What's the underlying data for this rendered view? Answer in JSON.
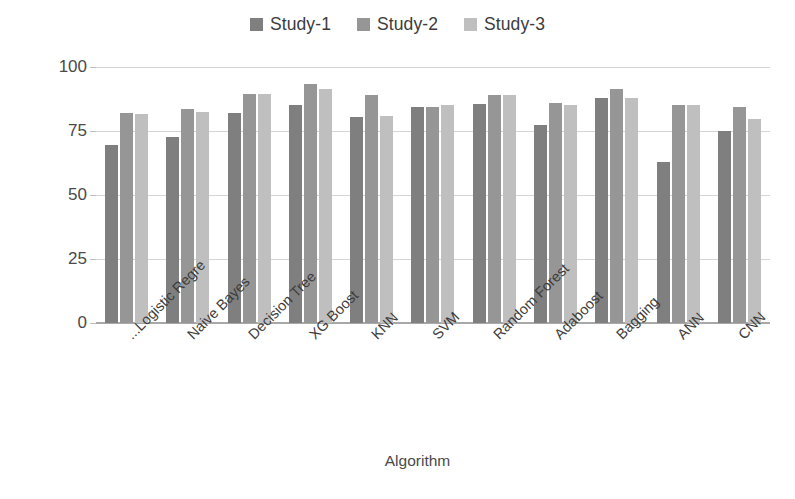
{
  "chart_data": {
    "type": "bar",
    "title": "",
    "xlabel": "Algorithm",
    "ylabel": "Accuracy (%)",
    "ylim": [
      0,
      100
    ],
    "yticks": [
      0,
      25,
      50,
      75,
      100
    ],
    "grid": true,
    "legend_position": "top-center",
    "categories": [
      "Logistic Regre...",
      "Naive Bayes",
      "Decision Tree",
      "XG Boost",
      "KNN",
      "SVM",
      "Random Forest",
      "Adaboost",
      "Bagging",
      "ANN",
      "CNN"
    ],
    "series": [
      {
        "name": "Study-1",
        "color": "#7f7f7f",
        "values": [
          69.5,
          72.5,
          82,
          85,
          80.5,
          84.5,
          85.5,
          77.5,
          88,
          63,
          75
        ]
      },
      {
        "name": "Study-2",
        "color": "#969696",
        "values": [
          82,
          83.5,
          89.5,
          93.5,
          89,
          84.5,
          89,
          86,
          91.5,
          85,
          84.5
        ]
      },
      {
        "name": "Study-3",
        "color": "#bfbfbf",
        "values": [
          81.5,
          82.5,
          89.5,
          91.5,
          81,
          85,
          89,
          85,
          88,
          85,
          79.5
        ]
      }
    ]
  }
}
